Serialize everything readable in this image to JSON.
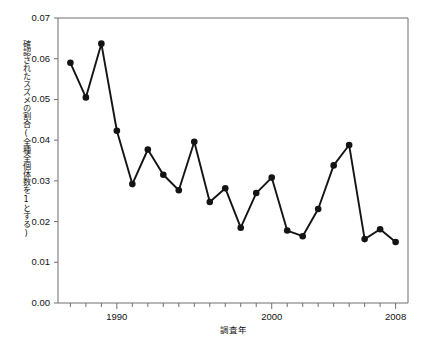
{
  "chart_data": {
    "type": "line",
    "title": "",
    "xlabel": "調査年",
    "ylabel": "確認されたスズメの割合(全種全個体数を1とする)",
    "xlim": [
      1986.2,
      2008.8
    ],
    "ylim": [
      0.0,
      0.07
    ],
    "grid": false,
    "legend": null,
    "marker": "filled-circle",
    "line_color": "#141414",
    "marker_color": "#141414",
    "x_tick_labels": [
      "1990",
      "2000",
      "2008"
    ],
    "x_labeled_ticks": [
      1990,
      2000,
      2008
    ],
    "x_minor_tick_years": [
      1987,
      1988,
      1989,
      1990,
      1991,
      1992,
      1993,
      1994,
      1995,
      1996,
      1997,
      1998,
      1999,
      2000,
      2001,
      2002,
      2003,
      2004,
      2005,
      2006,
      2007,
      2008
    ],
    "y_tick_labels": [
      "0.00",
      "0.01",
      "0.02",
      "0.03",
      "0.04",
      "0.05",
      "0.06",
      "0.07"
    ],
    "y_tick_values": [
      0.0,
      0.01,
      0.02,
      0.03,
      0.04,
      0.05,
      0.06,
      0.07
    ],
    "x": [
      1987,
      1988,
      1989,
      1990,
      1991,
      1992,
      1993,
      1994,
      1995,
      1996,
      1997,
      1998,
      1999,
      2000,
      2001,
      2002,
      2003,
      2004,
      2005,
      2006,
      2007,
      2008
    ],
    "values": [
      0.059,
      0.0505,
      0.0637,
      0.0423,
      0.0292,
      0.0377,
      0.0315,
      0.0277,
      0.0396,
      0.0248,
      0.0282,
      0.0185,
      0.027,
      0.0308,
      0.0178,
      0.0164,
      0.0231,
      0.0338,
      0.0388,
      0.0157,
      0.0181,
      0.015
    ],
    "points": [
      {
        "year": 1987,
        "value": 0.059
      },
      {
        "year": 1988,
        "value": 0.0505
      },
      {
        "year": 1989,
        "value": 0.0637
      },
      {
        "year": 1990,
        "value": 0.0423
      },
      {
        "year": 1991,
        "value": 0.0292
      },
      {
        "year": 1992,
        "value": 0.0377
      },
      {
        "year": 1993,
        "value": 0.0315
      },
      {
        "year": 1994,
        "value": 0.0277
      },
      {
        "year": 1995,
        "value": 0.0396
      },
      {
        "year": 1996,
        "value": 0.0248
      },
      {
        "year": 1997,
        "value": 0.0282
      },
      {
        "year": 1998,
        "value": 0.0185
      },
      {
        "year": 1999,
        "value": 0.027
      },
      {
        "year": 2000,
        "value": 0.0308
      },
      {
        "year": 2001,
        "value": 0.0178
      },
      {
        "year": 2002,
        "value": 0.0164
      },
      {
        "year": 2003,
        "value": 0.0231
      },
      {
        "year": 2004,
        "value": 0.0338
      },
      {
        "year": 2005,
        "value": 0.0388
      },
      {
        "year": 2006,
        "value": 0.0157
      },
      {
        "year": 2007,
        "value": 0.0181
      },
      {
        "year": 2008,
        "value": 0.015
      }
    ]
  }
}
